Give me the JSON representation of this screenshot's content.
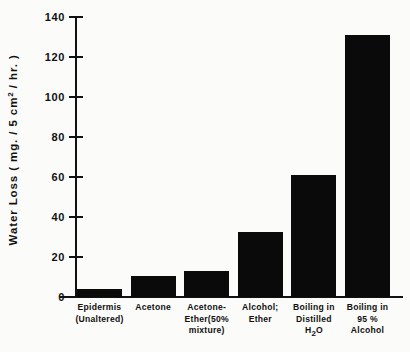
{
  "chart_data": {
    "type": "bar",
    "title": "",
    "xlabel": "",
    "ylabel": "Water Loss (mg./5 cm2/hr.)",
    "ylim": [
      0,
      140
    ],
    "yticks": [
      0,
      20,
      40,
      60,
      80,
      100,
      120,
      140
    ],
    "grid": false,
    "legend": "none",
    "categories": [
      "Epidermis (Unaltered)",
      "Acetone",
      "Acetone-Ether (50% mixture)",
      "Alcohol; Ether",
      "Boiling in Distilled H2O",
      "Boiling in 95% Alcohol"
    ],
    "values": [
      4,
      10.5,
      13,
      32.5,
      61,
      131
    ],
    "bar_color": "#0a0a0a"
  },
  "axis": {
    "y_title_parts": {
      "lead": "Water  Loss  ( mg. / 5 cm",
      "sup": "2",
      "tail": " / hr. )"
    },
    "tick_labels": [
      "140",
      "120",
      "100",
      "80",
      "60",
      "40",
      "20",
      "0"
    ]
  },
  "category_labels": [
    {
      "lines": [
        "Epidermis",
        "(Unaltered)"
      ]
    },
    {
      "lines": [
        "Acetone"
      ]
    },
    {
      "lines": [
        "Acetone-",
        "Ether(50%",
        "mixture)"
      ]
    },
    {
      "lines": [
        "Alcohol;",
        "Ether"
      ]
    },
    {
      "lines": [
        "Boiling in",
        "Distilled",
        "H2O"
      ]
    },
    {
      "lines": [
        "Boiling in",
        "95 %",
        "Alcohol"
      ]
    }
  ]
}
